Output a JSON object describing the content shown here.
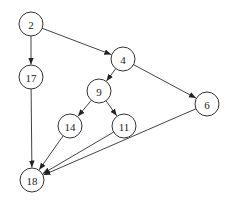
{
  "graph": {
    "type": "directed",
    "node_radius": 12,
    "colors": {
      "node_stroke": "#333333",
      "edge": "#444444",
      "background": "#ffffff"
    },
    "nodes": [
      {
        "id": "2",
        "label": "2",
        "x": 31,
        "y": 24
      },
      {
        "id": "17",
        "label": "17",
        "x": 31,
        "y": 77
      },
      {
        "id": "4",
        "label": "4",
        "x": 123,
        "y": 59
      },
      {
        "id": "9",
        "label": "9",
        "x": 99,
        "y": 91
      },
      {
        "id": "6",
        "label": "6",
        "x": 207,
        "y": 104
      },
      {
        "id": "14",
        "label": "14",
        "x": 70,
        "y": 126
      },
      {
        "id": "11",
        "label": "11",
        "x": 124,
        "y": 126
      },
      {
        "id": "18",
        "label": "18",
        "x": 32,
        "y": 180
      }
    ],
    "edges": [
      {
        "from": "2",
        "to": "17"
      },
      {
        "from": "2",
        "to": "4"
      },
      {
        "from": "4",
        "to": "9"
      },
      {
        "from": "4",
        "to": "6"
      },
      {
        "from": "9",
        "to": "14"
      },
      {
        "from": "9",
        "to": "11"
      },
      {
        "from": "17",
        "to": "18"
      },
      {
        "from": "14",
        "to": "18"
      },
      {
        "from": "11",
        "to": "18"
      },
      {
        "from": "6",
        "to": "18"
      }
    ]
  }
}
